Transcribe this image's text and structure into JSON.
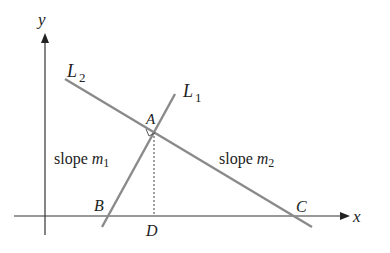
{
  "diagram": {
    "axes": {
      "x_label": "x",
      "y_label": "y"
    },
    "lines": [
      {
        "id": "L1",
        "label": "L",
        "subscript": "1",
        "slope_text": "slope ",
        "slope_var": "m",
        "slope_sub": "1"
      },
      {
        "id": "L2",
        "label": "L",
        "subscript": "2",
        "slope_text": "slope ",
        "slope_var": "m",
        "slope_sub": "2"
      }
    ],
    "points": {
      "A": "A",
      "B": "B",
      "C": "C",
      "D": "D"
    },
    "colors": {
      "line": "#8a8a8a",
      "axis": "#333333",
      "text": "#222222"
    }
  }
}
